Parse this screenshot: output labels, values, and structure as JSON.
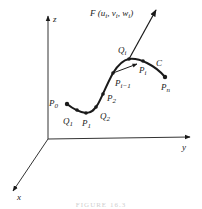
{
  "figure": {
    "type": "3d-curve-diagram",
    "axes": {
      "x_label": "x",
      "y_label": "y",
      "z_label": "z"
    },
    "force_label": "F (uᵢ, vᵢ, wᵢ)",
    "force_label_parts": {
      "main": "F (u",
      "s1": "i",
      "m2": ", v",
      "s2": "i",
      "m3": ", w",
      "s3": "i",
      "end": ")"
    },
    "curve_label": "C",
    "points": [
      {
        "name": "P0",
        "base": "P",
        "sub": "0"
      },
      {
        "name": "Q1",
        "base": "Q",
        "sub": "1"
      },
      {
        "name": "P1",
        "base": "P",
        "sub": "1"
      },
      {
        "name": "Q2",
        "base": "Q",
        "sub": "2"
      },
      {
        "name": "P2",
        "base": "P",
        "sub": "2"
      },
      {
        "name": "Pi-1",
        "base": "P",
        "sub": "i−1"
      },
      {
        "name": "Qi",
        "base": "Q",
        "sub": "i"
      },
      {
        "name": "Pi",
        "base": "P",
        "sub": "i"
      },
      {
        "name": "Pn",
        "base": "P",
        "sub": "n"
      }
    ],
    "caption": "FIGURE 16.3"
  },
  "colors": {
    "ink": "#1a1a1a",
    "axis": "#333333",
    "background": "#ffffff"
  }
}
